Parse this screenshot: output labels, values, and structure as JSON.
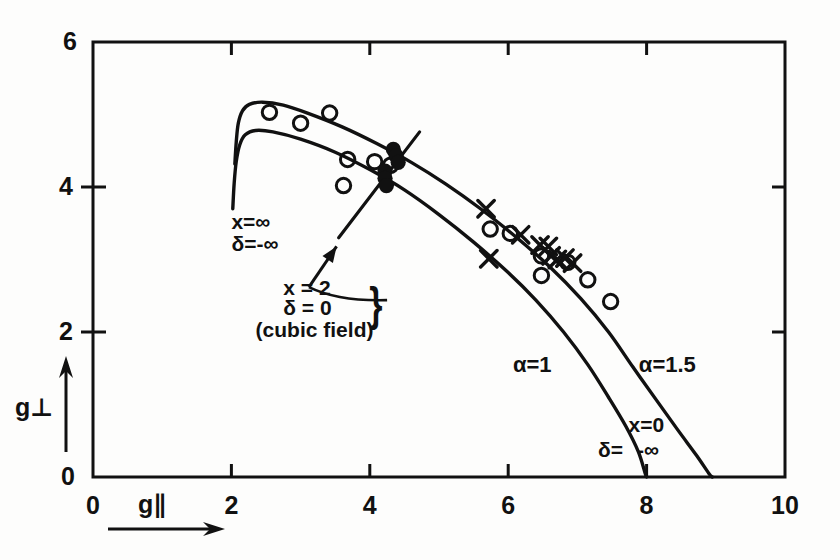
{
  "chart_data": {
    "type": "scatter",
    "title": "",
    "xlabel": "g∥",
    "ylabel": "g⊥",
    "xlim": [
      0,
      10
    ],
    "ylim": [
      0,
      6
    ],
    "xticks": [
      0,
      2,
      4,
      6,
      8,
      10
    ],
    "yticks": [
      0,
      2,
      4,
      6
    ],
    "grid": false,
    "legend_position": "inline-curve-labels",
    "series": [
      {
        "name": "α=1 theoretical curve",
        "type": "line",
        "label": "α=1",
        "label_xy": [
          6.35,
          1.55
        ],
        "points": [
          [
            2.02,
            3.7
          ],
          [
            2.04,
            4.05
          ],
          [
            2.07,
            4.35
          ],
          [
            2.12,
            4.58
          ],
          [
            2.2,
            4.72
          ],
          [
            2.35,
            4.78
          ],
          [
            2.6,
            4.76
          ],
          [
            3.0,
            4.66
          ],
          [
            3.5,
            4.48
          ],
          [
            4.0,
            4.24
          ],
          [
            4.5,
            3.96
          ],
          [
            5.0,
            3.62
          ],
          [
            5.5,
            3.24
          ],
          [
            6.0,
            2.82
          ],
          [
            6.4,
            2.44
          ],
          [
            6.8,
            2.0
          ],
          [
            7.15,
            1.55
          ],
          [
            7.45,
            1.1
          ],
          [
            7.7,
            0.7
          ],
          [
            7.88,
            0.35
          ],
          [
            7.98,
            0.05
          ],
          [
            8.0,
            0.0
          ]
        ]
      },
      {
        "name": "α=1.5 theoretical curve",
        "type": "line",
        "label": "α=1.5",
        "label_xy": [
          8.3,
          1.55
        ],
        "points": [
          [
            2.05,
            4.32
          ],
          [
            2.07,
            4.62
          ],
          [
            2.1,
            4.88
          ],
          [
            2.16,
            5.05
          ],
          [
            2.26,
            5.14
          ],
          [
            2.45,
            5.17
          ],
          [
            2.75,
            5.13
          ],
          [
            3.1,
            5.02
          ],
          [
            3.6,
            4.83
          ],
          [
            4.1,
            4.6
          ],
          [
            4.6,
            4.34
          ],
          [
            5.1,
            4.04
          ],
          [
            5.6,
            3.7
          ],
          [
            6.1,
            3.32
          ],
          [
            6.6,
            2.9
          ],
          [
            7.05,
            2.46
          ],
          [
            7.45,
            2.0
          ],
          [
            7.8,
            1.52
          ],
          [
            8.15,
            1.05
          ],
          [
            8.45,
            0.65
          ],
          [
            8.72,
            0.3
          ],
          [
            8.9,
            0.05
          ],
          [
            8.95,
            0.0
          ]
        ]
      },
      {
        "name": "cubic field line",
        "type": "line",
        "points": [
          [
            3.55,
            3.3
          ],
          [
            4.72,
            4.76
          ]
        ]
      },
      {
        "name": "open circles",
        "marker": "o",
        "points": [
          [
            2.55,
            5.03
          ],
          [
            3.0,
            4.88
          ],
          [
            3.42,
            5.02
          ],
          [
            3.68,
            4.38
          ],
          [
            3.62,
            4.02
          ],
          [
            4.07,
            4.35
          ],
          [
            4.3,
            4.3
          ],
          [
            5.74,
            3.42
          ],
          [
            6.03,
            3.36
          ],
          [
            6.48,
            3.05
          ],
          [
            6.48,
            2.78
          ],
          [
            6.86,
            2.96
          ],
          [
            7.15,
            2.72
          ],
          [
            7.48,
            2.42
          ]
        ]
      },
      {
        "name": "crosses",
        "marker": "x",
        "points": [
          [
            5.68,
            3.7
          ],
          [
            5.72,
            3.01
          ],
          [
            6.18,
            3.34
          ],
          [
            6.46,
            3.2
          ],
          [
            6.58,
            3.18
          ],
          [
            6.62,
            3.05
          ],
          [
            6.71,
            3.0
          ],
          [
            6.82,
            3.02
          ],
          [
            6.93,
            2.95
          ]
        ]
      },
      {
        "name": "filled circles",
        "marker": "filled",
        "points": [
          [
            4.34,
            4.52
          ],
          [
            4.38,
            4.43
          ],
          [
            4.41,
            4.34
          ],
          [
            4.22,
            4.22
          ],
          [
            4.22,
            4.12
          ],
          [
            4.24,
            4.02
          ]
        ]
      }
    ],
    "annotations": [
      {
        "name": "x-infinity-label",
        "text": "x=∞",
        "xy": [
          2.0,
          3.52
        ]
      },
      {
        "name": "delta-minus-infinity-label",
        "text": "δ=-∞",
        "xy": [
          2.0,
          3.22
        ]
      },
      {
        "name": "cubic-x-label",
        "text": "x = 2",
        "xy": [
          2.75,
          2.62
        ]
      },
      {
        "name": "cubic-delta-label",
        "text": "δ = 0",
        "xy": [
          2.75,
          2.34
        ]
      },
      {
        "name": "cubic-field-label",
        "text": "(cubic field)",
        "xy": [
          2.35,
          2.04
        ]
      },
      {
        "name": "brace-label",
        "text": "}",
        "xy": [
          4.05,
          2.48
        ]
      },
      {
        "name": "x-zero-label",
        "text": "x=0",
        "xy": [
          8.0,
          0.72
        ]
      },
      {
        "name": "delta-minus-infinity-label-2",
        "text": "δ=",
        "xy": [
          7.48,
          0.38
        ]
      },
      {
        "name": "minus-infinity-label",
        "text": "-∞",
        "xy": [
          8.02,
          0.38
        ]
      }
    ]
  },
  "axes": {
    "x_label": "g∥",
    "y_label": "g⊥",
    "x_tick_labels": [
      "0",
      "2",
      "4",
      "6",
      "8",
      "10"
    ],
    "y_tick_labels": [
      "0",
      "2",
      "4",
      "6"
    ]
  },
  "colors": {
    "ink": "#111111",
    "background": "#fdfdfc"
  }
}
